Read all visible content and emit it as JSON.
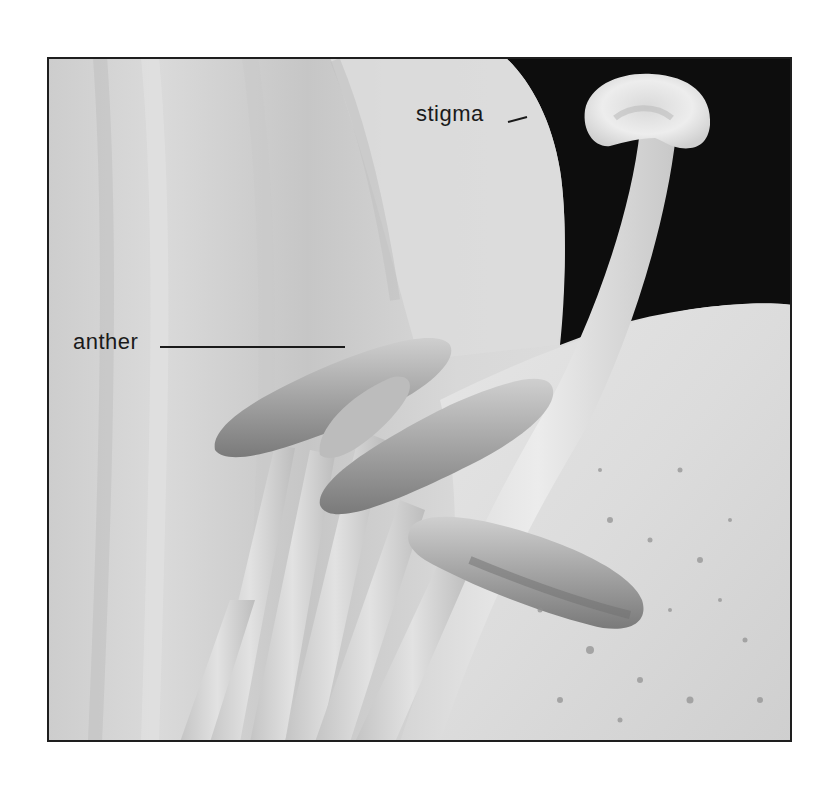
{
  "figure": {
    "frame_color": "#1e1e1e",
    "colors": {
      "petal_light": "#e4e4e4",
      "petal_mid": "#cfcfcf",
      "petal_shadow": "#b4b4b4",
      "background_dark": "#0d0d0d",
      "anther": "#a9a9a9",
      "anther_dark": "#7c7c7c",
      "stigma": "#e9e9e9",
      "label_text": "#1a1a1a"
    }
  },
  "labels": {
    "stigma": {
      "text": "stigma",
      "leader": {
        "x1": 508,
        "y1": 122,
        "x2": 527,
        "y2": 117
      }
    },
    "anther": {
      "text": "anther",
      "leader": {
        "x1": 160,
        "y1": 347,
        "x2": 345,
        "y2": 347
      }
    }
  }
}
